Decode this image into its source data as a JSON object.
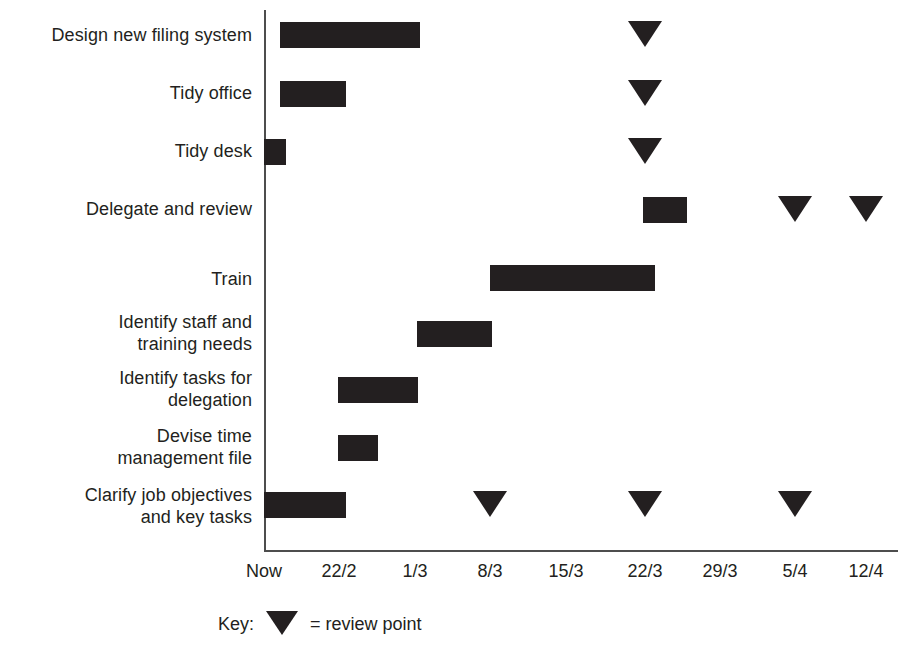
{
  "chart_data": {
    "type": "bar",
    "chart_style": "gantt",
    "title": "",
    "xlabel": "",
    "ylabel": "",
    "grid": false,
    "x_axis": {
      "tick_labels": [
        "Now",
        "22/2",
        "1/3",
        "8/3",
        "15/3",
        "22/3",
        "29/3",
        "5/4",
        "12/4"
      ],
      "tick_x_px": [
        264,
        339,
        415,
        490,
        566,
        645,
        720,
        795,
        866
      ],
      "range_label_start": "Now",
      "range_label_end": "12/4"
    },
    "categories": [
      "Design new filing system",
      "Tidy office",
      "Tidy desk",
      "Delegate and review",
      "Train",
      "Identify staff and\ntraining needs",
      "Identify tasks for\ndelegation",
      "Devise time\nmanagement file",
      "Clarify job objectives\nand key tasks"
    ],
    "tasks": [
      {
        "name": "Design new filing system",
        "label_top_px": 24,
        "row_top_px": 22,
        "bar": {
          "start_label": "Now",
          "end_label": "1/3",
          "start_px": 280,
          "width_px": 140
        },
        "review_points": [
          {
            "label": "22/3",
            "x_px": 645
          }
        ]
      },
      {
        "name": "Tidy office",
        "label_top_px": 82,
        "row_top_px": 81,
        "bar": {
          "start_label": "Now",
          "end_label": "22/2",
          "start_px": 280,
          "width_px": 66
        },
        "review_points": [
          {
            "label": "22/3",
            "x_px": 645
          }
        ]
      },
      {
        "name": "Tidy desk",
        "label_top_px": 140,
        "row_top_px": 139,
        "bar": {
          "start_label": "Now",
          "end_label": "Now",
          "start_px": 264,
          "width_px": 22
        },
        "review_points": [
          {
            "label": "22/3",
            "x_px": 645
          }
        ]
      },
      {
        "name": "Delegate and review",
        "label_top_px": 198,
        "row_top_px": 197,
        "bar": {
          "start_label": "22/3",
          "end_label": "26/3",
          "start_px": 643,
          "width_px": 44
        },
        "review_points": [
          {
            "label": "5/4",
            "x_px": 795
          },
          {
            "label": "12/4",
            "x_px": 866
          }
        ]
      },
      {
        "name": "Train",
        "label_top_px": 268,
        "row_top_px": 265,
        "bar": {
          "start_label": "8/3",
          "end_label": "22/3",
          "start_px": 490,
          "width_px": 165
        },
        "review_points": []
      },
      {
        "name": "Identify staff and training needs",
        "label_top_px": 311,
        "row_top_px": 321,
        "bar": {
          "start_label": "1/3",
          "end_label": "8/3",
          "start_px": 417,
          "width_px": 75
        },
        "review_points": []
      },
      {
        "name": "Identify tasks for delegation",
        "label_top_px": 367,
        "row_top_px": 377,
        "bar": {
          "start_label": "22/2",
          "end_label": "1/3",
          "start_px": 338,
          "width_px": 80
        },
        "review_points": []
      },
      {
        "name": "Devise time management file",
        "label_top_px": 425,
        "row_top_px": 435,
        "bar": {
          "start_label": "22/2",
          "end_label": "26/2",
          "start_px": 338,
          "width_px": 40
        },
        "review_points": []
      },
      {
        "name": "Clarify job objectives and key tasks",
        "label_top_px": 484,
        "row_top_px": 492,
        "bar": {
          "start_label": "Now",
          "end_label": "22/2",
          "start_px": 264,
          "width_px": 82
        },
        "review_points": [
          {
            "label": "8/3",
            "x_px": 490
          },
          {
            "label": "22/3",
            "x_px": 645
          },
          {
            "label": "5/4",
            "x_px": 795
          }
        ]
      }
    ],
    "legend": {
      "position": "bottom-left",
      "key_text": "Key:",
      "marker_meaning": "= review point"
    },
    "colors": {
      "bar": "#231f20",
      "marker": "#231f20",
      "axis": "#4d4d4d",
      "text": "#231f20",
      "background": "#ffffff"
    }
  },
  "labels": {
    "task_0": "Design new filing system",
    "task_1": "Tidy office",
    "task_2": "Tidy desk",
    "task_3": "Delegate and review",
    "task_4": "Train",
    "task_5": "Identify staff and\ntraining needs",
    "task_6": "Identify tasks for\ndelegation",
    "task_7": "Devise time\nmanagement file",
    "task_8": "Clarify job objectives\nand key tasks"
  },
  "legend": {
    "key_text": "Key:",
    "marker_meaning": "= review point"
  }
}
